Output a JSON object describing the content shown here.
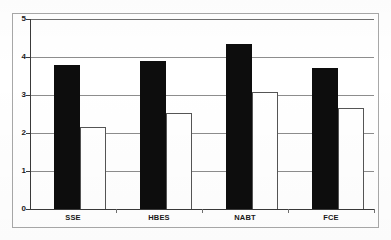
{
  "chart_data": {
    "type": "bar",
    "title": "",
    "subtitle": "",
    "xlabel": "",
    "ylabel": "",
    "ylim": [
      0,
      5
    ],
    "yticks": [
      0,
      1,
      2,
      3,
      4,
      5
    ],
    "ytick_labels": [
      "0",
      "1",
      "2",
      "3",
      "4",
      "5"
    ],
    "grid": true,
    "grid_axis": "y",
    "legend": false,
    "legend_position": "none",
    "categories": [
      "SSE",
      "HBES",
      "NABT",
      "FCE"
    ],
    "series": [
      {
        "name": "series-dark",
        "color": "#0d0d0d",
        "fill": "solid-black",
        "values": [
          3.78,
          3.9,
          4.34,
          3.71
        ]
      },
      {
        "name": "series-light",
        "color": "#ffffff",
        "fill": "white-outlined",
        "values": [
          2.16,
          2.53,
          3.08,
          2.66
        ]
      }
    ]
  },
  "axes": {
    "y_tick_0": "0",
    "y_tick_1": "1",
    "y_tick_2": "2",
    "y_tick_3": "3",
    "y_tick_4": "4",
    "y_tick_5": "5"
  },
  "categories": {
    "c0": "SSE",
    "c1": "HBES",
    "c2": "NABT",
    "c3": "FCE"
  },
  "colors": {
    "bar_dark": "#0d0d0d",
    "bar_light": "#ffffff",
    "bar_light_outline": "#555555",
    "gridline": "#8d8d8d",
    "axis": "#3a3a3a",
    "frame": "#a8a8a8",
    "background": "#ffffff",
    "text": "#1a1a1a"
  }
}
